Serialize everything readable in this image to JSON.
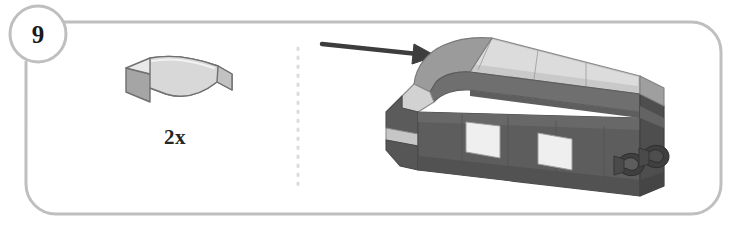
{
  "document": {
    "type": "lego-building-instruction-step",
    "background_color": "#ffffff"
  },
  "step": {
    "number": "9",
    "badge_name": "step-number-badge"
  },
  "frame": {
    "border_color": "#bfbfbf",
    "corner_radius": 34,
    "stroke_width": 3
  },
  "parts_panel": {
    "divider": {
      "style": "dotted",
      "color": "#d9d9d9"
    },
    "parts": [
      {
        "name": "curved-slope-3x1",
        "quantity_label": "2x",
        "colors": {
          "top": "#e8e8e8",
          "side": "#a8a8a8",
          "front": "#cfcfcf",
          "outline": "#6e6e6e"
        }
      }
    ]
  },
  "assembly": {
    "name": "train-car-model",
    "arrow": {
      "name": "placement-arrow",
      "color": "#3d3d3d",
      "direction": "right"
    },
    "colors": {
      "body_dark": "#585858",
      "body_dark_shadow": "#4a4a4a",
      "body_mid": "#6e6e6e",
      "roof_light": "#c9c9c9",
      "roof_mid": "#a3a3a3",
      "roof_dark": "#8a8a8a",
      "window": "#efefef",
      "nose_light": "#d6d6d6",
      "coupler": "#3f3f3f",
      "outline": "#7a7a7a"
    },
    "windows_count": 2,
    "coupler_count": 2
  }
}
